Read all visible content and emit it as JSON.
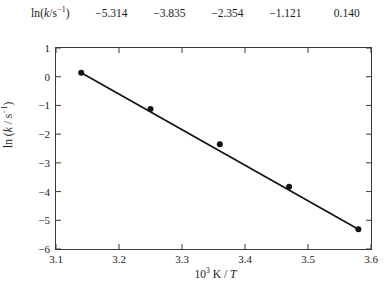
{
  "table": {
    "row_label_parts": {
      "pre": "ln(",
      "ital": "k",
      "mid": "/s",
      "sup": "−1",
      "post": ")"
    },
    "row_label_plain": "ln(k/s⁻¹)",
    "values": [
      "−5.314",
      "−3.835",
      "−2.354",
      "−1.121",
      "0.140"
    ]
  },
  "axes": {
    "y_title_parts": {
      "pre": "ln (",
      "ital": "k",
      "mid": " / s",
      "sup": "−1",
      "post": ")"
    },
    "y_title_plain": "ln (k / s⁻¹)",
    "x_title_parts": {
      "base": "10",
      "exp": "3",
      "rest": " K / ",
      "ital": "T"
    },
    "x_title_plain": "10³ K / T",
    "y_ticks": [
      "1",
      "0",
      "−1",
      "−2",
      "−3",
      "−4",
      "−5",
      "−6"
    ],
    "x_ticks": [
      "3.1",
      "3.2",
      "3.3",
      "3.4",
      "3.5",
      "3.6"
    ]
  },
  "chart_data": {
    "type": "scatter",
    "title": "",
    "xlabel": "10³ K / T",
    "ylabel": "ln (k / s⁻¹)",
    "xlim": [
      3.1,
      3.6
    ],
    "ylim": [
      -6,
      1
    ],
    "xticks": [
      3.1,
      3.2,
      3.3,
      3.4,
      3.5,
      3.6
    ],
    "yticks": [
      1,
      0,
      -1,
      -2,
      -3,
      -4,
      -5,
      -6
    ],
    "grid": false,
    "legend": false,
    "marker_color": "#111111",
    "line_color": "#111111",
    "x": [
      3.14,
      3.25,
      3.36,
      3.47,
      3.58
    ],
    "y": [
      0.14,
      -1.121,
      -2.354,
      -3.835,
      -5.314
    ],
    "fit_line": {
      "x": [
        3.14,
        3.58
      ],
      "y": [
        0.14,
        -5.314
      ]
    },
    "series": [
      {
        "name": "ln(k/s⁻¹) vs 10³ K/T",
        "points": [
          {
            "x": 3.14,
            "y": 0.14
          },
          {
            "x": 3.25,
            "y": -1.121
          },
          {
            "x": 3.36,
            "y": -2.354
          },
          {
            "x": 3.47,
            "y": -3.835
          },
          {
            "x": 3.58,
            "y": -5.314
          }
        ]
      }
    ]
  }
}
